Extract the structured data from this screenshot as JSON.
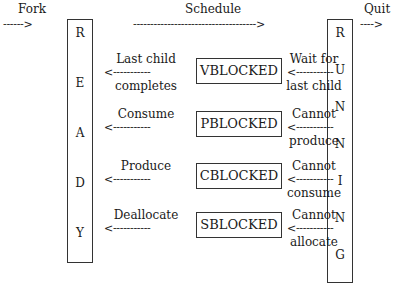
{
  "top": {
    "fork_label": "Fork",
    "fork_arrow": "------>",
    "schedule_label": "Schedule",
    "schedule_arrow": "------------------------------------>",
    "quit_label": "Quit",
    "quit_arrow": "---->"
  },
  "ready": {
    "letters": [
      "R",
      "E",
      "A",
      "D",
      "Y"
    ]
  },
  "running": {
    "letters": [
      "R",
      "U",
      "N",
      "N",
      "I",
      "N",
      "G"
    ]
  },
  "states": [
    {
      "name": "VBLOCKED",
      "left_label_top": "Last child",
      "left_arrow": "<-----------",
      "left_label_bottom": "completes",
      "right_label_top": "Wait for",
      "right_arrow": "<-----------",
      "right_label_bottom": "last child"
    },
    {
      "name": "PBLOCKED",
      "left_label_top": "Consume",
      "left_arrow": "<-----------",
      "left_label_bottom": "",
      "right_label_top": "Cannot",
      "right_arrow": "<-----------",
      "right_label_bottom": "produce"
    },
    {
      "name": "CBLOCKED",
      "left_label_top": "Produce",
      "left_arrow": "<-----------",
      "left_label_bottom": "",
      "right_label_top": "Cannot",
      "right_arrow": "<-----------",
      "right_label_bottom": "consume"
    },
    {
      "name": "SBLOCKED",
      "left_label_top": "Deallocate",
      "left_arrow": "<-----------",
      "left_label_bottom": "",
      "right_label_top": "Cannot",
      "right_arrow": "<-----------",
      "right_label_bottom": "allocate"
    }
  ]
}
